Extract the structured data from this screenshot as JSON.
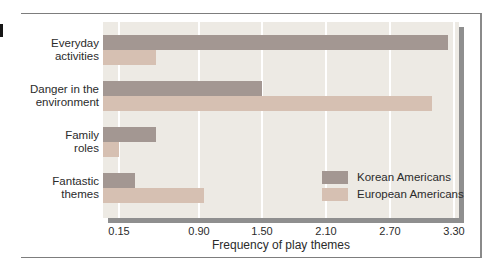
{
  "chart_data": {
    "type": "bar",
    "orientation": "horizontal",
    "title": "",
    "xlabel": "Frequency of play themes",
    "ylabel": "",
    "categories": [
      "Everyday activities",
      "Danger in the environment",
      "Family roles",
      "Fantastic themes"
    ],
    "category_label_lines": [
      [
        "Everyday",
        "activities"
      ],
      [
        "Danger in the",
        "environment"
      ],
      [
        "Family",
        "roles"
      ],
      [
        "Fantastic",
        "themes"
      ]
    ],
    "series": [
      {
        "name": "Korean Americans",
        "color": "#a39792",
        "values": [
          3.25,
          1.5,
          0.5,
          0.3
        ]
      },
      {
        "name": "European Americans",
        "color": "#d6c0b2",
        "values": [
          0.5,
          3.1,
          0.15,
          0.95
        ]
      }
    ],
    "x_tick_labels": [
      "0.15",
      "0.90",
      "1.50",
      "2.10",
      "2.70",
      "3.30"
    ],
    "x_tick_values": [
      0.15,
      0.9,
      1.5,
      2.1,
      2.7,
      3.3
    ],
    "xlim": [
      0,
      3.35
    ],
    "grid": "vertical white lines at x ticks",
    "legend_position": "inside lower-right of plot",
    "colors": {
      "plot_bg": "#edeae4",
      "plot_shadow": "#8f8f8f",
      "gridline": "#ffffff",
      "text": "#2b2b2b",
      "figure_border": "#7d7d7d",
      "margin_tab": "#161616"
    }
  }
}
